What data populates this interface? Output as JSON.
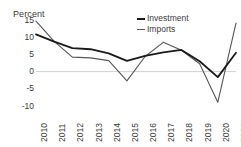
{
  "chart_data": {
    "type": "line",
    "title": "Percent",
    "xlabel": "",
    "ylabel": "Percent",
    "ylim": [
      -10,
      15
    ],
    "yticks": [
      15,
      10,
      5,
      0,
      -5,
      -10
    ],
    "grid": "zero-line-only",
    "legend_position": "top-right",
    "categories": [
      "2010",
      "2011",
      "2012",
      "2013",
      "2014",
      "2015",
      "2016",
      "2017",
      "2018",
      "2019",
      "2020",
      "2021"
    ],
    "series": [
      {
        "name": "Investment",
        "color": "#1a1a1a",
        "values": [
          10.8,
          8.7,
          6.8,
          6.5,
          5.3,
          3.1,
          4.6,
          5.6,
          6.3,
          3.0,
          -1.6,
          5.5
        ]
      },
      {
        "name": "Imports",
        "color": "#555555",
        "values": [
          14.7,
          8.8,
          4.2,
          4.0,
          3.2,
          -2.7,
          4.4,
          8.5,
          6.2,
          2.3,
          -8.9,
          14.1
        ]
      }
    ]
  },
  "legend": {
    "items": [
      {
        "label": "Investment",
        "key": "investment"
      },
      {
        "label": "Imports",
        "key": "imports"
      }
    ]
  },
  "colors": {
    "investment": "#1a1a1a",
    "imports": "#555555",
    "zero_line": "#d0d0d0",
    "text": "#3b3b3b",
    "background": "#ffffff"
  }
}
